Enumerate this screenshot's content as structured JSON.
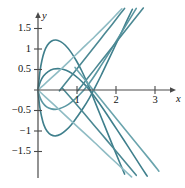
{
  "figure": {
    "title": "",
    "background_color": "#ffffff"
  },
  "axes": {
    "x_axis_label": "x",
    "y_axis_label": "y",
    "axis_color": "#4a4a4a",
    "origin_px": {
      "x": 38,
      "y": 90
    },
    "px_per_unit_x": 39,
    "px_per_unit_y": 41,
    "x_ticks": [
      {
        "value": 1,
        "label": "1"
      },
      {
        "value": 2,
        "label": "2"
      },
      {
        "value": 3,
        "label": "3"
      }
    ],
    "y_ticks": [
      {
        "value": 1.5,
        "label": "1.5"
      },
      {
        "value": 1,
        "label": "1"
      },
      {
        "value": 0.5,
        "label": "0.5"
      },
      {
        "value": -0.5,
        "label": "−0.5"
      },
      {
        "value": -1,
        "label": "−1"
      },
      {
        "value": -1.5,
        "label": "−1.5"
      }
    ]
  },
  "chart_data": {
    "type": "line",
    "title": "",
    "xlabel": "x",
    "ylabel": "y",
    "xlim": [
      -0.1,
      3.6
    ],
    "ylim": [
      -2.1,
      1.85
    ],
    "grid": false,
    "legend": null,
    "series": [
      {
        "name": "curve-arch-high",
        "color": "#3f7f8c",
        "width": 1.6,
        "points": [
          [
            0.0,
            0.0
          ],
          [
            0.05,
            0.45
          ],
          [
            0.1,
            0.72
          ],
          [
            0.16,
            0.93
          ],
          [
            0.24,
            1.09
          ],
          [
            0.34,
            1.19
          ],
          [
            0.46,
            1.22
          ],
          [
            0.58,
            1.18
          ],
          [
            0.7,
            1.09
          ],
          [
            0.84,
            0.93
          ],
          [
            0.98,
            0.72
          ],
          [
            1.12,
            0.47
          ],
          [
            1.26,
            0.18
          ],
          [
            1.36,
            -0.05
          ],
          [
            1.5,
            -0.38
          ],
          [
            1.7,
            -0.85
          ],
          [
            1.9,
            -1.32
          ],
          [
            2.1,
            -1.78
          ],
          [
            2.22,
            -2.05
          ]
        ]
      },
      {
        "name": "curve-arch-low",
        "color": "#3f7f8c",
        "width": 1.6,
        "points": [
          [
            0.0,
            0.0
          ],
          [
            0.06,
            0.2
          ],
          [
            0.14,
            0.34
          ],
          [
            0.26,
            0.45
          ],
          [
            0.4,
            0.51
          ],
          [
            0.56,
            0.52
          ],
          [
            0.72,
            0.48
          ],
          [
            0.88,
            0.4
          ],
          [
            1.04,
            0.28
          ],
          [
            1.2,
            0.13
          ],
          [
            1.32,
            0.0
          ],
          [
            1.48,
            -0.2
          ],
          [
            1.7,
            -0.5
          ],
          [
            1.95,
            -0.86
          ],
          [
            2.2,
            -1.22
          ],
          [
            2.45,
            -1.59
          ],
          [
            2.66,
            -1.9
          ],
          [
            2.8,
            -2.1
          ]
        ]
      },
      {
        "name": "curve-valley-deep",
        "color": "#3f7f8c",
        "width": 1.6,
        "points": [
          [
            0.0,
            0.0
          ],
          [
            0.04,
            -0.38
          ],
          [
            0.09,
            -0.64
          ],
          [
            0.15,
            -0.85
          ],
          [
            0.23,
            -1.0
          ],
          [
            0.33,
            -1.09
          ],
          [
            0.45,
            -1.12
          ],
          [
            0.58,
            -1.08
          ],
          [
            0.72,
            -0.98
          ],
          [
            0.86,
            -0.84
          ],
          [
            1.0,
            -0.66
          ],
          [
            1.16,
            -0.44
          ],
          [
            1.32,
            -0.19
          ],
          [
            1.45,
            0.04
          ],
          [
            1.62,
            0.36
          ],
          [
            1.82,
            0.76
          ],
          [
            2.05,
            1.22
          ],
          [
            2.28,
            1.69
          ],
          [
            2.42,
            1.97
          ]
        ]
      },
      {
        "name": "curve-valley-shallow",
        "color": "#5a97a2",
        "width": 1.6,
        "points": [
          [
            0.0,
            0.0
          ],
          [
            0.05,
            -0.18
          ],
          [
            0.12,
            -0.31
          ],
          [
            0.22,
            -0.41
          ],
          [
            0.34,
            -0.46
          ],
          [
            0.48,
            -0.47
          ],
          [
            0.62,
            -0.43
          ],
          [
            0.78,
            -0.35
          ],
          [
            0.94,
            -0.23
          ],
          [
            1.1,
            -0.08
          ],
          [
            1.22,
            0.05
          ],
          [
            1.4,
            0.28
          ],
          [
            1.62,
            0.6
          ],
          [
            1.86,
            0.96
          ],
          [
            2.1,
            1.34
          ],
          [
            2.32,
            1.68
          ],
          [
            2.52,
            1.99
          ]
        ]
      },
      {
        "name": "line-rising-pale",
        "color": "#8fbcc4",
        "width": 1.6,
        "points": [
          [
            0.0,
            0.0
          ],
          [
            0.12,
            0.1
          ],
          [
            0.28,
            0.24
          ],
          [
            0.5,
            0.43
          ],
          [
            0.8,
            0.7
          ],
          [
            1.1,
            0.98
          ],
          [
            1.45,
            1.3
          ],
          [
            1.8,
            1.63
          ],
          [
            2.05,
            1.88
          ],
          [
            2.15,
            1.98
          ]
        ]
      },
      {
        "name": "line-falling-pale",
        "color": "#8fbcc4",
        "width": 1.6,
        "points": [
          [
            0.0,
            0.0
          ],
          [
            0.18,
            -0.16
          ],
          [
            0.42,
            -0.37
          ],
          [
            0.7,
            -0.62
          ],
          [
            1.05,
            -0.93
          ],
          [
            1.45,
            -1.28
          ],
          [
            1.85,
            -1.64
          ],
          [
            2.25,
            -1.99
          ],
          [
            2.4,
            -2.12
          ]
        ]
      },
      {
        "name": "line-rising-steep",
        "color": "#4b8893",
        "width": 1.6,
        "points": [
          [
            0.55,
            -0.02
          ],
          [
            0.75,
            0.22
          ],
          [
            1.0,
            0.52
          ],
          [
            1.3,
            0.88
          ],
          [
            1.6,
            1.24
          ],
          [
            1.9,
            1.6
          ],
          [
            2.12,
            1.87
          ],
          [
            2.22,
            1.99
          ]
        ]
      },
      {
        "name": "line-falling-steep",
        "color": "#4b8893",
        "width": 1.6,
        "points": [
          [
            0.62,
            0.05
          ],
          [
            0.85,
            -0.2
          ],
          [
            1.12,
            -0.5
          ],
          [
            1.42,
            -0.84
          ],
          [
            1.75,
            -1.21
          ],
          [
            2.08,
            -1.58
          ],
          [
            2.38,
            -1.92
          ],
          [
            2.52,
            -2.08
          ]
        ]
      },
      {
        "name": "line-rising-outer",
        "color": "#4b8893",
        "width": 1.6,
        "points": [
          [
            1.02,
            -0.02
          ],
          [
            1.25,
            0.26
          ],
          [
            1.55,
            0.62
          ],
          [
            1.85,
            0.98
          ],
          [
            2.15,
            1.34
          ],
          [
            2.45,
            1.7
          ],
          [
            2.7,
            2.0
          ]
        ]
      },
      {
        "name": "line-falling-outer",
        "color": "#6aa4ad",
        "width": 1.6,
        "points": [
          [
            0.95,
            0.55
          ],
          [
            1.18,
            0.28
          ],
          [
            1.45,
            -0.04
          ],
          [
            1.78,
            -0.43
          ],
          [
            2.12,
            -0.83
          ],
          [
            2.48,
            -1.25
          ],
          [
            2.85,
            -1.68
          ],
          [
            3.1,
            -1.98
          ]
        ]
      }
    ]
  }
}
